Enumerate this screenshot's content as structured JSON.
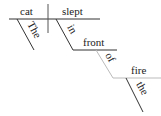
{
  "diagram": {
    "type": "sentence-diagram",
    "subject": "cat",
    "verb": "slept",
    "subject_modifier": "The",
    "preposition": "in",
    "prep_object": "front",
    "sub_preposition": "of",
    "sub_object": "fire",
    "sub_object_modifier": "the"
  }
}
